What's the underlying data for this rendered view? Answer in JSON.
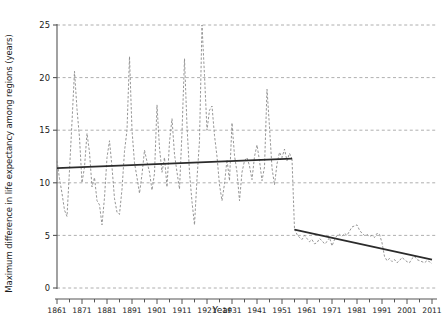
{
  "chart_data": {
    "type": "line",
    "title": "",
    "xlabel": "Year",
    "ylabel": "Maximum difference in life expectancy among regions (years)",
    "xlim": [
      1861,
      2013
    ],
    "ylim": [
      0,
      26
    ],
    "grid": true,
    "legend": "none",
    "colors": {
      "series_line": "#8a8a8a",
      "trend_line": "#2b2b2b",
      "grid": "#9a9a9a",
      "axis": "#555555",
      "background": "#ffffff"
    },
    "xticks": [
      1861,
      1871,
      1881,
      1891,
      1901,
      1911,
      1921,
      1931,
      1941,
      1951,
      1961,
      1971,
      1981,
      1991,
      2001,
      2011
    ],
    "xticklabels": [
      "1861",
      "1871",
      "1881",
      "1891",
      "1901",
      "1911",
      "1921",
      "1931",
      "1941",
      "1951",
      "1961",
      "1971",
      "1981",
      "1991",
      "2001",
      "2011"
    ],
    "xminor_tick_step": 5,
    "yticks": [
      0,
      5,
      10,
      15,
      20,
      25
    ],
    "yticklabels": [
      "0",
      "5",
      "10",
      "15",
      "20",
      "25"
    ],
    "series": [
      {
        "name": "Maximum regional difference in life expectancy",
        "style": "dashed",
        "x": [
          1861,
          1862,
          1863,
          1864,
          1865,
          1866,
          1867,
          1868,
          1869,
          1870,
          1871,
          1872,
          1873,
          1874,
          1875,
          1876,
          1877,
          1878,
          1879,
          1880,
          1881,
          1882,
          1883,
          1884,
          1885,
          1886,
          1887,
          1888,
          1889,
          1890,
          1891,
          1892,
          1893,
          1894,
          1895,
          1896,
          1897,
          1898,
          1899,
          1900,
          1901,
          1902,
          1903,
          1904,
          1905,
          1906,
          1907,
          1908,
          1909,
          1910,
          1911,
          1912,
          1913,
          1914,
          1915,
          1916,
          1917,
          1918,
          1919,
          1920,
          1921,
          1922,
          1923,
          1924,
          1925,
          1926,
          1927,
          1928,
          1929,
          1930,
          1931,
          1932,
          1933,
          1934,
          1935,
          1936,
          1937,
          1938,
          1939,
          1940,
          1941,
          1942,
          1943,
          1944,
          1945,
          1946,
          1947,
          1948,
          1949,
          1950,
          1951,
          1952,
          1953,
          1954,
          1955,
          1956,
          1957,
          1958,
          1959,
          1960,
          1961,
          1962,
          1963,
          1964,
          1965,
          1966,
          1967,
          1968,
          1969,
          1970,
          1971,
          1972,
          1973,
          1974,
          1975,
          1976,
          1977,
          1978,
          1979,
          1980,
          1981,
          1982,
          1983,
          1984,
          1985,
          1986,
          1987,
          1988,
          1989,
          1990,
          1991,
          1992,
          1993,
          1994,
          1995,
          1996,
          1997,
          1998,
          1999,
          2000,
          2001,
          2002,
          2003,
          2004,
          2005,
          2006,
          2007,
          2008,
          2009,
          2010,
          2011
        ],
        "y": [
          12.1,
          10.4,
          9.0,
          7.4,
          6.8,
          11.2,
          15.8,
          20.6,
          17.0,
          14.3,
          10.0,
          11.5,
          14.7,
          12.9,
          9.6,
          10.5,
          8.3,
          7.9,
          6.0,
          8.6,
          12.4,
          14.0,
          11.5,
          8.5,
          7.2,
          7.0,
          9.4,
          13.0,
          15.0,
          22.0,
          15.0,
          11.9,
          10.5,
          9.0,
          10.8,
          13.1,
          12.0,
          11.0,
          9.3,
          10.9,
          17.4,
          13.3,
          11.0,
          12.4,
          9.6,
          13.9,
          16.1,
          12.7,
          11.0,
          9.4,
          14.8,
          21.8,
          15.4,
          11.0,
          8.2,
          6.0,
          10.4,
          14.0,
          25.0,
          20.2,
          15.0,
          16.9,
          17.3,
          14.5,
          12.5,
          9.8,
          8.3,
          9.9,
          12.2,
          10.2,
          15.7,
          12.6,
          11.0,
          8.3,
          11.0,
          12.1,
          12.4,
          11.6,
          10.3,
          12.5,
          13.6,
          12.1,
          10.2,
          11.5,
          18.9,
          15.3,
          11.4,
          9.8,
          11.8,
          12.9,
          12.4,
          13.2,
          12.1,
          12.8,
          12.3,
          5.6,
          5.1,
          4.8,
          4.6,
          5.0,
          4.7,
          4.4,
          4.6,
          4.2,
          4.3,
          4.7,
          4.5,
          4.2,
          4.4,
          4.8,
          4.0,
          4.6,
          5.0,
          5.1,
          4.9,
          5.2,
          5.0,
          5.4,
          5.8,
          5.9,
          6.0,
          5.5,
          5.2,
          5.0,
          5.1,
          4.9,
          5.0,
          4.8,
          5.2,
          5.1,
          4.3,
          3.0,
          2.6,
          2.8,
          2.5,
          2.7,
          2.4,
          2.6,
          2.9,
          2.7,
          2.5,
          2.4,
          2.8,
          3.0,
          2.7,
          2.6,
          2.5,
          2.4,
          2.6,
          2.5,
          2.3
        ]
      }
    ],
    "trend_lines": [
      {
        "name": "pre-break-trend",
        "x": [
          1861,
          1955
        ],
        "y": [
          11.4,
          12.3
        ],
        "style": "solid"
      },
      {
        "name": "post-break-trend",
        "x": [
          1956,
          2011
        ],
        "y": [
          5.55,
          2.7
        ],
        "style": "solid"
      }
    ],
    "break_year": 1955,
    "break_from": 12.3,
    "break_to": 5.6
  }
}
